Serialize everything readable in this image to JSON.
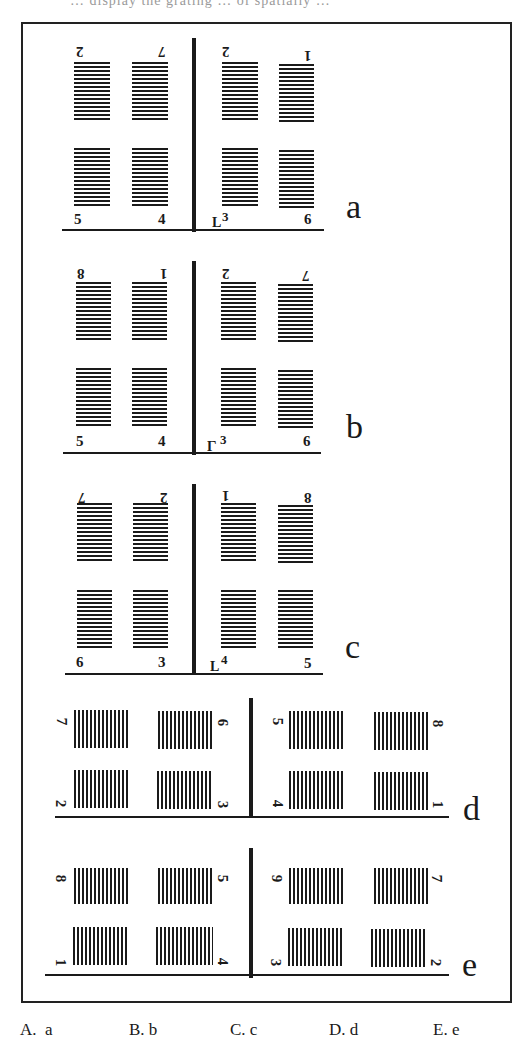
{
  "header": {
    "cut_text": "… display the grating … of spatially …"
  },
  "question": {
    "panels": [
      {
        "id": "a",
        "label": "a",
        "top_labels": [
          "2",
          "7",
          "2",
          "1"
        ],
        "top_labels_flipped": true,
        "bottom_labels": [
          "5",
          "4",
          "3",
          "6"
        ],
        "marker": "L",
        "grating_orientation": "horizontal"
      },
      {
        "id": "b",
        "label": "b",
        "top_labels": [
          "8",
          "1",
          "2",
          "7"
        ],
        "top_labels_flipped": true,
        "bottom_labels": [
          "5",
          "4",
          "3",
          "6"
        ],
        "marker": "L (rotated)",
        "grating_orientation": "horizontal"
      },
      {
        "id": "c",
        "label": "c",
        "top_labels": [
          "7",
          "2",
          "1",
          "8"
        ],
        "top_labels_flipped": true,
        "bottom_labels": [
          "6",
          "3",
          "4",
          "5"
        ],
        "marker": "L",
        "grating_orientation": "horizontal"
      },
      {
        "id": "d",
        "label": "d",
        "top_labels": [
          "7",
          "6",
          "5",
          "8"
        ],
        "bottom_labels": [
          "2",
          "3",
          "4",
          "1"
        ],
        "labels_rotated": true,
        "grating_orientation": "vertical"
      },
      {
        "id": "e",
        "label": "e",
        "top_labels": [
          "8",
          "5",
          "9",
          "7"
        ],
        "bottom_labels": [
          "1",
          "4",
          "3",
          "2"
        ],
        "labels_rotated": true,
        "grating_orientation": "vertical"
      }
    ],
    "options": [
      {
        "letter": "A.",
        "value": "a"
      },
      {
        "letter": "B.",
        "value": "b"
      },
      {
        "letter": "C.",
        "value": "c"
      },
      {
        "letter": "D.",
        "value": "d"
      },
      {
        "letter": "E.",
        "value": "e"
      }
    ]
  }
}
